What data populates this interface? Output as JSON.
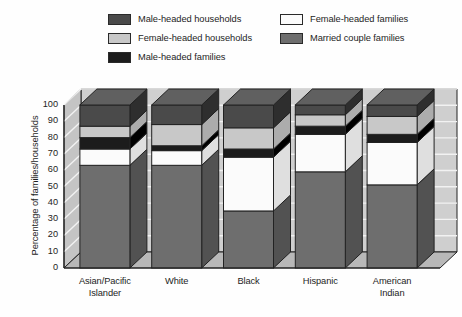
{
  "legend": {
    "columns": [
      {
        "items": [
          {
            "label": "Male-headed households",
            "color": "#4a4a4a",
            "name": "legend-male-headed-households"
          },
          {
            "label": "Female-headed households",
            "color": "#c8c8c8",
            "name": "legend-female-headed-households"
          },
          {
            "label": "Male-headed families",
            "color": "#1c1c1c",
            "name": "legend-male-headed-families"
          }
        ]
      },
      {
        "items": [
          {
            "label": "Female-headed families",
            "color": "#fbfbfb",
            "name": "legend-female-headed-families"
          },
          {
            "label": "Married couple families",
            "color": "#6e6e6e",
            "name": "legend-married-couple-families"
          }
        ]
      }
    ]
  },
  "axes": {
    "ylabel": "Percentage of families/households",
    "yticks": [
      "100",
      "90",
      "80",
      "70",
      "60",
      "50",
      "40",
      "30",
      "20",
      "10",
      "0"
    ],
    "ymin": 0,
    "ymax": 100
  },
  "chart_data": {
    "type": "bar",
    "subtype": "stacked-3d",
    "title": "",
    "xlabel": "",
    "ylabel": "Percentage of families/households",
    "ylim": [
      0,
      100
    ],
    "grid": true,
    "legend_position": "top",
    "categories": [
      "Asian/Pacific Islander",
      "White",
      "Black",
      "Hispanic",
      "American Indian"
    ],
    "category_lines": [
      [
        "Asian/Pacific",
        "Islander"
      ],
      [
        "White"
      ],
      [
        "Black"
      ],
      [
        "Hispanic"
      ],
      [
        "American",
        "Indian"
      ]
    ],
    "stack_order_bottom_to_top": [
      "Married couple families",
      "Female-headed families",
      "Male-headed families",
      "Female-headed households",
      "Male-headed households"
    ],
    "series": [
      {
        "name": "Married couple families",
        "color": "#6e6e6e",
        "values": [
          63,
          63,
          35,
          59,
          51
        ]
      },
      {
        "name": "Female-headed families",
        "color": "#fbfbfb",
        "values": [
          10,
          9,
          33,
          23,
          26
        ]
      },
      {
        "name": "Male-headed families",
        "color": "#1c1c1c",
        "values": [
          7,
          3,
          5,
          5,
          5
        ]
      },
      {
        "name": "Female-headed households",
        "color": "#c8c8c8",
        "values": [
          7,
          13,
          13,
          7,
          11
        ]
      },
      {
        "name": "Male-headed households",
        "color": "#4a4a4a",
        "values": [
          13,
          12,
          14,
          6,
          7
        ]
      }
    ]
  },
  "colors": {
    "background": "#fefefe",
    "plot_wall": "#cfcfcf",
    "plot_floor": "#bdbdbd",
    "outline": "#222222",
    "text": "#1d1d1d"
  }
}
